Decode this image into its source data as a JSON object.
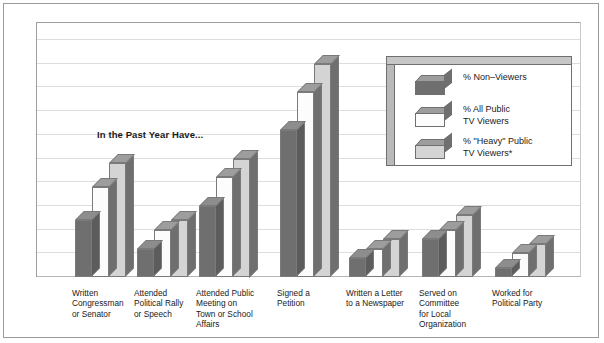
{
  "annotation": "In the Past Year Have...",
  "legend": {
    "entries": [
      {
        "label": "% Non–Viewers"
      },
      {
        "label": "% All Public\nTV Viewers"
      },
      {
        "label": "% \"Heavy\" Public\nTV Viewers*"
      }
    ]
  },
  "chart_data": {
    "type": "bar",
    "title": "",
    "subtitle": "",
    "annotation": "In the Past Year Have...",
    "xlabel": "",
    "ylabel": "",
    "ylim": [
      0,
      50
    ],
    "grid": true,
    "gridline_step": 5,
    "legend_position": "inside-top-right",
    "categories": [
      "Written\nCongressman\nor Senator",
      "Attended\nPolitical Rally\nor Speech",
      "Attended Public\nMeeting on\nTown or School\nAffairs",
      "Signed a\nPetition",
      "Written a Letter\nto a Newspaper",
      "Served on\nCommittee\nfor Local\nOrganization",
      "Worked for\nPolitical Party"
    ],
    "series": [
      {
        "name": "% Non–Viewers",
        "color": "#6f6f6f",
        "values": [
          12,
          6,
          15,
          31,
          4,
          8,
          2
        ]
      },
      {
        "name": "% All Public TV Viewers",
        "color": "#fcfcfc",
        "values": [
          19,
          10,
          21,
          39,
          6,
          10,
          5
        ]
      },
      {
        "name": "% \"Heavy\" Public TV Viewers*",
        "color": "#d4d4d4",
        "values": [
          24,
          12,
          25,
          45,
          8,
          13,
          7
        ]
      }
    ]
  }
}
